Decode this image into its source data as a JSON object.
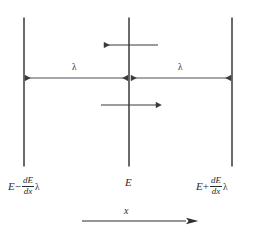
{
  "figure": {
    "name": "energy-transport-mean-free-path-diagram",
    "background_color": "#ffffff",
    "stroke_color": "#3a3a3a",
    "text_color": "#2b2b2b",
    "width": 259,
    "height": 232
  },
  "planes": {
    "left": {
      "x": 24,
      "y_top": 18,
      "y_bottom": 166,
      "label_prefix": "E",
      "label_operator": "−",
      "label_numerator": "dE",
      "label_denominator": "dx",
      "label_suffix": "λ",
      "label_full": "E − dE/dx λ"
    },
    "center": {
      "x": 129,
      "y_top": 18,
      "y_bottom": 166,
      "label_full": "E"
    },
    "right": {
      "x": 232,
      "y_top": 18,
      "y_bottom": 166,
      "label_prefix": "E",
      "label_operator": "+",
      "label_numerator": "dE",
      "label_denominator": "dx",
      "label_suffix": "λ",
      "label_full": "E + dE/dx λ"
    }
  },
  "flux_arrows": [
    {
      "name": "upper-leftward-flux-arrow",
      "direction": "left",
      "y": 45,
      "x_start": 158,
      "x_end": 104,
      "description": "energy flux arriving from the right plane"
    },
    {
      "name": "lower-rightward-flux-arrow",
      "direction": "right",
      "y": 105,
      "x_start": 101,
      "x_end": 156,
      "description": "energy flux arriving from the left plane"
    }
  ],
  "measurements": [
    {
      "name": "lambda-left-measure",
      "label": "λ",
      "from_x": 25,
      "to_x": 128,
      "y": 78,
      "label_x": 74,
      "label_y": 66
    },
    {
      "name": "lambda-right-measure",
      "label": "λ",
      "from_x": 131,
      "to_x": 231,
      "y": 78,
      "label_x": 180,
      "label_y": 66
    }
  ],
  "axis": {
    "name": "x-direction-axis",
    "label": "x",
    "y": 221,
    "x_start": 82,
    "x_end": 192,
    "label_x": 127,
    "label_y": 207
  }
}
